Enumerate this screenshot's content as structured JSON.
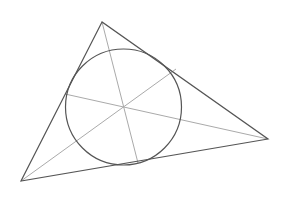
{
  "diagram": {
    "title": "",
    "type": "triangle-incircle-angle-bisectors",
    "background": "#ffffff",
    "colors": {
      "triangle": "#555555",
      "circle": "#555555",
      "bisector": "#aaaaaa"
    },
    "vertices": {
      "A": [
        102,
        22
      ],
      "B": [
        21,
        181
      ],
      "C": [
        268,
        139
      ]
    },
    "incircle": {
      "center": [
        123.5,
        107
      ],
      "radius": 58
    },
    "bisectors": [
      {
        "from": "A",
        "start": [
          102,
          22
        ],
        "end": [
          138,
          163
        ]
      },
      {
        "from": "B",
        "start": [
          21,
          181
        ],
        "end": [
          176,
          69
        ]
      },
      {
        "from": "C",
        "start": [
          268,
          139
        ],
        "end": [
          65,
          94
        ]
      }
    ]
  }
}
